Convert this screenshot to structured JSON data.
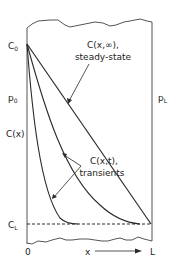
{
  "diagram": {
    "labels": {
      "c0": "C",
      "c0_sub": "0",
      "p0": "p",
      "p0_sub": "0",
      "cx": "C(x)",
      "cl": "C",
      "cl_sub": "L",
      "pl": "p",
      "pl_sub": "L",
      "origin": "0",
      "x_axis": "x",
      "length": "L",
      "steady_line1": "C(x,∞),",
      "steady_line2": "steady-state",
      "transient_line1": "C(x,t),",
      "transient_line2": "transients"
    },
    "colors": {
      "line": "#2a2a2a",
      "wall": "#555555",
      "background": "#ffffff"
    }
  }
}
